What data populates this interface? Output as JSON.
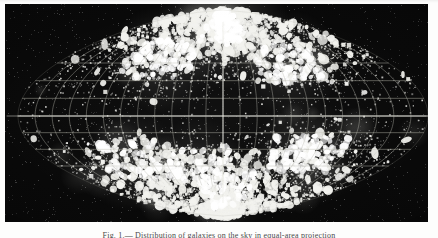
{
  "figure": {
    "caption": "Fig. 1.— Distribution of galaxies on the sky in equal-area projection",
    "background_color": "#070707",
    "page_color": "#fdfdfc",
    "point_color": "#f2f2ee",
    "grid_color": "#b9b9ae"
  },
  "chart_data": {
    "type": "scatter",
    "title": "Distribution of galaxies on the sky in equal-area projection",
    "projection": "sinusoidal-rhombic all-sky",
    "xlabel": "",
    "ylabel": "",
    "xlim": [
      -180,
      180
    ],
    "ylim": [
      -90,
      90
    ],
    "grid": true,
    "legend_position": "none",
    "graticule": {
      "meridian_step_deg": 15,
      "parallel_step_deg": 15,
      "equator_latitude_deg": 0,
      "visible_parallels_deg": [
        -45,
        -30,
        -15,
        0,
        15,
        30,
        45
      ],
      "visible_meridians_deg": [
        -165,
        -150,
        -135,
        -120,
        -105,
        -90,
        -75,
        -60,
        -45,
        -30,
        -15,
        0,
        15,
        30,
        45,
        60,
        75,
        90,
        105,
        120,
        135,
        150,
        165
      ]
    },
    "point_count": 6200,
    "density_description": "Point density rises steeply toward the north and south apexes of the projection, with the brightest concentration near the northern apex; several dense clumps lie in the southern hemisphere; the region near the equator band is comparatively sparse.",
    "density_peaks": [
      {
        "name": "north-apex-concentration",
        "x_deg": 0,
        "y_deg": 78,
        "relative_density": 1.0
      },
      {
        "name": "northwest-band",
        "x_deg": -70,
        "y_deg": 48,
        "relative_density": 0.72
      },
      {
        "name": "northeast-band",
        "x_deg": 72,
        "y_deg": 45,
        "relative_density": 0.7
      },
      {
        "name": "southwest-clump",
        "x_deg": -96,
        "y_deg": -40,
        "relative_density": 0.66
      },
      {
        "name": "south-central-clump",
        "x_deg": -28,
        "y_deg": -44,
        "relative_density": 0.58
      },
      {
        "name": "southeast-clump",
        "x_deg": 82,
        "y_deg": -34,
        "relative_density": 0.74
      },
      {
        "name": "south-apex-tail",
        "x_deg": 6,
        "y_deg": -66,
        "relative_density": 0.55
      },
      {
        "name": "equatorial-void",
        "x_deg": 0,
        "y_deg": 0,
        "relative_density": 0.12
      }
    ]
  }
}
